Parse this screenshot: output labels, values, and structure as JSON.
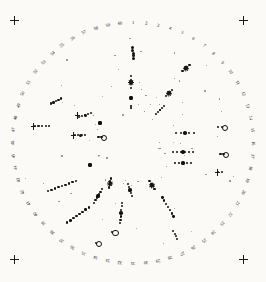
{
  "plate": {
    "title": "Circular scale plate",
    "background_color": "#fbfaf7",
    "ink_color": "#141414",
    "center": {
      "x": 133,
      "y": 143
    },
    "scale_radius": 115,
    "label_radius": 120,
    "divisions": 60,
    "start_label": 1,
    "start_angle_deg": 0,
    "direction": "clockwise"
  },
  "corner_marks": [
    {
      "name": "top-left",
      "x": 14,
      "y": 20,
      "glyph": "+"
    },
    {
      "name": "top-right",
      "x": 243,
      "y": 20,
      "glyph": "+"
    },
    {
      "name": "bottom-left",
      "x": 14,
      "y": 259,
      "glyph": "+"
    },
    {
      "name": "bottom-right",
      "x": 243,
      "y": 259,
      "glyph": "+"
    }
  ],
  "scale_labels": [
    "1",
    "2",
    "3",
    "4",
    "5",
    "6",
    "7",
    "8",
    "9",
    "10",
    "11",
    "12",
    "13",
    "14",
    "15",
    "16",
    "17",
    "18",
    "19",
    "20",
    "21",
    "22",
    "23",
    "24",
    "25",
    "26",
    "27",
    "28",
    "29",
    "30",
    "31",
    "32",
    "33",
    "34",
    "35",
    "36",
    "37",
    "38",
    "39",
    "40",
    "41",
    "42",
    "43",
    "44",
    "45",
    "46",
    "47",
    "48",
    "49",
    "50",
    "51",
    "52",
    "53",
    "54",
    "55",
    "56",
    "57",
    "58",
    "59",
    "60"
  ],
  "features": [
    {
      "name": "vertical-bead-chain-top",
      "cx": 133,
      "cy": 53,
      "angle": 92,
      "length": 13,
      "beads": 5,
      "bead_size": 3.0,
      "blob": 0
    },
    {
      "name": "cross-cluster-upper-center",
      "cx": 131,
      "cy": 82,
      "angle": 90,
      "length": 16,
      "beads": 4,
      "bead_size": 2.2,
      "blob": 3.6
    },
    {
      "name": "blob-upper-center",
      "cx": 131,
      "cy": 98,
      "angle": 90,
      "length": 4,
      "beads": 1,
      "bead_size": 3.8,
      "blob": 4.0
    },
    {
      "name": "tick-pair-upper-center",
      "cx": 131,
      "cy": 107,
      "angle": 90,
      "length": 5,
      "beads": 2,
      "bead_size": 1.6,
      "blob": 0
    },
    {
      "name": "star-cluster-upper-right",
      "cx": 186,
      "cy": 68,
      "angle": 40,
      "length": 12,
      "beads": 4,
      "bead_size": 2.4,
      "blob": 3.2
    },
    {
      "name": "star-cluster-right-upper",
      "cx": 169,
      "cy": 93,
      "angle": 40,
      "length": 11,
      "beads": 4,
      "bead_size": 2.2,
      "blob": 3.4
    },
    {
      "name": "diagonal-chain-right-upper",
      "cx": 160,
      "cy": 110,
      "angle": 45,
      "length": 14,
      "beads": 5,
      "bead_size": 2.0,
      "blob": 2.6
    },
    {
      "name": "row-cluster-right-a",
      "cx": 185,
      "cy": 133,
      "angle": 0,
      "length": 22,
      "beads": 5,
      "bead_size": 2.0,
      "blob": 3.6
    },
    {
      "name": "row-cluster-right-b",
      "cx": 183,
      "cy": 152,
      "angle": 0,
      "length": 24,
      "beads": 6,
      "bead_size": 1.9,
      "blob": 3.4
    },
    {
      "name": "row-cluster-right-c",
      "cx": 183,
      "cy": 163,
      "angle": 0,
      "length": 20,
      "beads": 5,
      "bead_size": 1.8,
      "blob": 3.2
    },
    {
      "name": "ring-pair-right-outer",
      "cx": 220,
      "cy": 127,
      "angle": 0,
      "length": 8,
      "beads": 2,
      "bead_size": 2.6,
      "blob": 0
    },
    {
      "name": "ring-right-middle",
      "cx": 222,
      "cy": 154,
      "angle": 0,
      "length": 6,
      "beads": 2,
      "bead_size": 2.8,
      "blob": 0
    },
    {
      "name": "f-glyph-right-lower",
      "cx": 220,
      "cy": 172,
      "angle": 0,
      "length": 7,
      "beads": 2,
      "bead_size": 2.0,
      "blob": 0
    },
    {
      "name": "f-glyph-left-outer",
      "cx": 42,
      "cy": 126,
      "angle": 0,
      "length": 18,
      "beads": 5,
      "bead_size": 2.2,
      "blob": 0
    },
    {
      "name": "bead-chain-left-upper",
      "cx": 56,
      "cy": 101,
      "angle": 28,
      "length": 14,
      "beads": 5,
      "bead_size": 2.4,
      "blob": 0
    },
    {
      "name": "f-glyph-center-left-a",
      "cx": 85,
      "cy": 115,
      "angle": 15,
      "length": 16,
      "beads": 5,
      "bead_size": 2.0,
      "blob": 3.0
    },
    {
      "name": "f-glyph-center-left-b",
      "cx": 80,
      "cy": 135,
      "angle": 0,
      "length": 14,
      "beads": 4,
      "bead_size": 2.0,
      "blob": 3.0
    },
    {
      "name": "blob-center-left",
      "cx": 100,
      "cy": 123,
      "angle": 0,
      "length": 5,
      "beads": 1,
      "bead_size": 3.6,
      "blob": 3.8
    },
    {
      "name": "ring-center-left",
      "cx": 100,
      "cy": 137,
      "angle": 0,
      "length": 6,
      "beads": 2,
      "bead_size": 2.4,
      "blob": 0
    },
    {
      "name": "long-chain-lower-left",
      "cx": 62,
      "cy": 186,
      "angle": 200,
      "length": 34,
      "beads": 9,
      "bead_size": 2.4,
      "blob": 0
    },
    {
      "name": "blob-lower-left-inner",
      "cx": 90,
      "cy": 165,
      "angle": 0,
      "length": 5,
      "beads": 1,
      "bead_size": 3.6,
      "blob": 3.8
    },
    {
      "name": "long-chain-lower-center-left",
      "cx": 78,
      "cy": 215,
      "angle": 215,
      "length": 30,
      "beads": 8,
      "bead_size": 2.4,
      "blob": 0
    },
    {
      "name": "diagonal-chain-lower-center",
      "cx": 98,
      "cy": 196,
      "angle": 240,
      "length": 20,
      "beads": 6,
      "bead_size": 2.2,
      "blob": 3.2
    },
    {
      "name": "vertical-chain-lower-center",
      "cx": 121,
      "cy": 213,
      "angle": 265,
      "length": 24,
      "beads": 7,
      "bead_size": 2.2,
      "blob": 3.4
    },
    {
      "name": "star-cluster-lower-center",
      "cx": 110,
      "cy": 183,
      "angle": 260,
      "length": 12,
      "beads": 4,
      "bead_size": 2.2,
      "blob": 3.0
    },
    {
      "name": "chain-lower-center-right",
      "cx": 130,
      "cy": 190,
      "angle": 285,
      "length": 16,
      "beads": 5,
      "bead_size": 2.2,
      "blob": 3.2
    },
    {
      "name": "star-cluster-lower-right",
      "cx": 152,
      "cy": 185,
      "angle": 300,
      "length": 13,
      "beads": 4,
      "bead_size": 2.2,
      "blob": 3.4
    },
    {
      "name": "long-chain-lower-right",
      "cx": 168,
      "cy": 207,
      "angle": 300,
      "length": 26,
      "beads": 7,
      "bead_size": 2.3,
      "blob": 0
    },
    {
      "name": "ring-bottom-center",
      "cx": 112,
      "cy": 232,
      "angle": 0,
      "length": 5,
      "beads": 1,
      "bead_size": 2.6,
      "blob": 0
    },
    {
      "name": "ring-bottom-left",
      "cx": 96,
      "cy": 243,
      "angle": 0,
      "length": 4,
      "beads": 1,
      "bead_size": 2.4,
      "blob": 0
    },
    {
      "name": "chain-bottom-right-edge",
      "cx": 175,
      "cy": 235,
      "angle": 290,
      "length": 12,
      "beads": 4,
      "bead_size": 2.0,
      "blob": 0
    }
  ]
}
